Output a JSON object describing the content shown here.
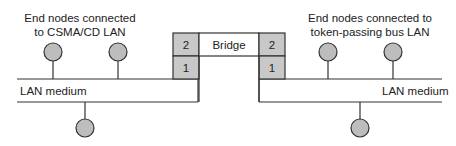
{
  "left_lan": {
    "caption_line1": "End nodes connected",
    "caption_line2": "to CSMA/CD LAN",
    "medium_label": "LAN medium"
  },
  "right_lan": {
    "caption_line1": "End nodes connected to",
    "caption_line2": "token-passing bus LAN",
    "medium_label": "LAN medium"
  },
  "bridge": {
    "label": "Bridge",
    "left_layers": [
      "2",
      "1"
    ],
    "right_layers": [
      "2",
      "1"
    ]
  },
  "colors": {
    "node_fill": "#bdbdbd",
    "layer_fill": "#c8c8c8",
    "line": "#333333"
  }
}
